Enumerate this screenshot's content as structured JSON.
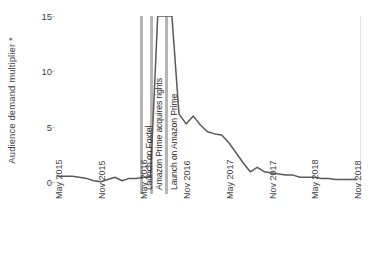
{
  "chart_data": {
    "type": "line",
    "title": "",
    "xlabel": "",
    "ylabel": "Audience demand multiplier *",
    "ylabel_text": "Audience demand multiplier",
    "ylabel_symbol": "*",
    "ylim": [
      0,
      16
    ],
    "yticks": [
      0,
      5,
      10,
      15
    ],
    "grid": false,
    "legend": "none",
    "x_tick_labels": [
      "May 2015",
      "Nov 2015",
      "May 2016",
      "Nov 2016",
      "May 2017",
      "Nov 2017",
      "May 2018",
      "Nov 2018"
    ],
    "x_range_start": "May 2015",
    "x_range_end": "Nov 2018",
    "series": [
      {
        "name": "Audience demand multiplier",
        "color": "#595959",
        "x": [
          "May 2015",
          "Jun 2015",
          "Jul 2015",
          "Aug 2015",
          "Sep 2015",
          "Oct 2015",
          "Nov 2015",
          "Dec 2015",
          "Jan 2016",
          "Feb 2016",
          "Mar 2016",
          "Apr 2016",
          "May 2016",
          "Jun 2016",
          "Jul 2016",
          "Aug 2016",
          "Sep 2016",
          "Oct 2016",
          "Nov 2016",
          "Dec 2016",
          "Jan 2017",
          "Feb 2017",
          "Mar 2017",
          "Apr 2017",
          "May 2017",
          "Jun 2017",
          "Jul 2017",
          "Aug 2017",
          "Sep 2017",
          "Oct 2017",
          "Nov 2017",
          "Dec 2017",
          "Jan 2018",
          "Feb 2018",
          "Mar 2018",
          "Apr 2018",
          "May 2018",
          "Jun 2018",
          "Jul 2018",
          "Aug 2018",
          "Sep 2018",
          "Oct 2018",
          "Nov 2018"
        ],
        "values": [
          1.6,
          1.6,
          1.6,
          1.5,
          1.4,
          1.2,
          1.1,
          1.3,
          1.5,
          1.2,
          1.4,
          1.4,
          1.5,
          1.5,
          16.0,
          16.0,
          16.0,
          7.2,
          6.3,
          7.0,
          6.2,
          5.6,
          5.4,
          5.3,
          4.6,
          3.7,
          2.8,
          2.0,
          2.4,
          2.0,
          1.9,
          1.8,
          1.7,
          1.7,
          1.5,
          1.5,
          1.5,
          1.4,
          1.4,
          1.3,
          1.3,
          1.3,
          1.3
        ]
      }
    ],
    "annotations": [
      {
        "label": "Launch on Foxtel",
        "x": "Jul 2016"
      },
      {
        "label": "Amazon Prime acquires rights",
        "x": "Aug 2016"
      },
      {
        "label": "Launch on Amazon Prime",
        "x": "Sep 2016"
      }
    ],
    "note": "Line runs off the top of the plot between Jul 2016 and Sep 2016 (values exceed the 15 axis maximum)."
  },
  "axis_colors": {
    "line": "#595959",
    "axis": "#c9c9c9",
    "annotation_band": "#b5b5b5",
    "text": "#3f3f3f"
  }
}
